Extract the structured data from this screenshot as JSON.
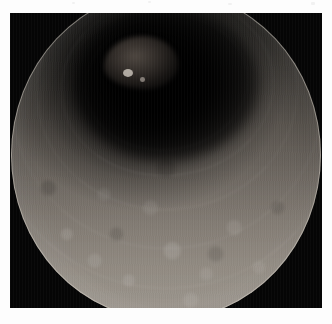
{
  "viewer": {
    "media_type": "endoscopic-still-image",
    "modality_label": "White-light endoscopy",
    "matte_color": "#fdfdfd",
    "frame_background_color": "#050505",
    "frame": {
      "x": 10,
      "y": 13,
      "width": 312,
      "height": 295
    }
  },
  "field_of_view": {
    "shape": "circle-cropped-top-and-bottom",
    "center_x_pct": 50,
    "center_y_pct": 48,
    "diameter_px": 310,
    "rim_color": "#d7d2c8",
    "mucosa_bright_color": "#98938c",
    "mucosa_mid_color": "#6d6a65",
    "mucosa_dark_color": "#2c2c2a"
  },
  "scene": {
    "lumen": {
      "name": "lumen-shadow",
      "center_x_pct": 50,
      "center_y_pct": 29,
      "color": "#000000"
    },
    "lesion": {
      "name": "polypoid-mound",
      "center_x_pct": 42,
      "center_y_pct": 22,
      "color": "#968878"
    },
    "folds": [
      {
        "name": "fold-1",
        "rotation_deg": -6
      },
      {
        "name": "fold-2",
        "rotation_deg": -4
      },
      {
        "name": "fold-3",
        "rotation_deg": -3
      },
      {
        "name": "fold-4",
        "rotation_deg": -2
      },
      {
        "name": "fold-5",
        "rotation_deg": -1
      },
      {
        "name": "fold-6",
        "rotation_deg": -8
      }
    ],
    "specular_highlights": [
      {
        "name": "highlight-primary",
        "x_pct": 36,
        "y_pct": 24
      },
      {
        "name": "highlight-secondary",
        "x_pct": 41.5,
        "y_pct": 26.5
      }
    ]
  },
  "matte_artifacts": [
    {
      "x": 72,
      "y": 2,
      "w": 3,
      "h": 2
    },
    {
      "x": 148,
      "y": 1,
      "w": 3,
      "h": 2
    },
    {
      "x": 228,
      "y": 3,
      "w": 4,
      "h": 2
    },
    {
      "x": 311,
      "y": 2,
      "w": 4,
      "h": 3
    }
  ]
}
